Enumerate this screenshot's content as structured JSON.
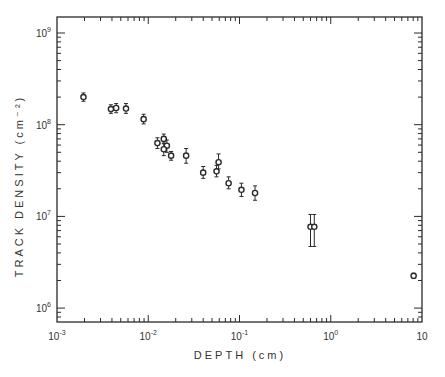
{
  "chart_data": {
    "type": "scatter",
    "title": "",
    "xlabel": "DEPTH (cm)",
    "ylabel": "TRACK DENSITY (cm⁻²)",
    "xscale": "log",
    "yscale": "log",
    "xlim": [
      0.001,
      10
    ],
    "ylim": [
      700000,
      1400000000
    ],
    "x_ticks": [
      {
        "value": 0.001,
        "base": "10",
        "exp": "-3"
      },
      {
        "value": 0.01,
        "base": "10",
        "exp": "-2"
      },
      {
        "value": 0.1,
        "base": "10",
        "exp": "-1"
      },
      {
        "value": 1,
        "base": "10",
        "exp": "0"
      },
      {
        "value": 10,
        "base": "10",
        "exp": ""
      }
    ],
    "y_ticks": [
      {
        "value": 1000000,
        "base": "10",
        "exp": "6"
      },
      {
        "value": 10000000,
        "base": "10",
        "exp": "7"
      },
      {
        "value": 100000000,
        "base": "10",
        "exp": "8"
      },
      {
        "value": 1000000000,
        "base": "10",
        "exp": "9"
      }
    ],
    "grid": false,
    "legend": null,
    "series": [
      {
        "name": "track density",
        "marker": "open-circle",
        "points": [
          {
            "x": 0.00195,
            "y": 200000000,
            "err_lo": 180000000,
            "err_hi": 222000000
          },
          {
            "x": 0.0039,
            "y": 148000000,
            "err_lo": 133000000,
            "err_hi": 165000000
          },
          {
            "x": 0.00445,
            "y": 152000000,
            "err_lo": 135000000,
            "err_hi": 170000000
          },
          {
            "x": 0.0057,
            "y": 150000000,
            "err_lo": 133000000,
            "err_hi": 170000000
          },
          {
            "x": 0.0089,
            "y": 115000000,
            "err_lo": 102000000,
            "err_hi": 130000000
          },
          {
            "x": 0.0126,
            "y": 63000000,
            "err_lo": 55000000,
            "err_hi": 72000000
          },
          {
            "x": 0.0148,
            "y": 70000000,
            "err_lo": 62000000,
            "err_hi": 79000000
          },
          {
            "x": 0.016,
            "y": 59000000,
            "err_lo": 50000000,
            "err_hi": 68000000
          },
          {
            "x": 0.0148,
            "y": 54000000,
            "err_lo": 46000000,
            "err_hi": 63000000
          },
          {
            "x": 0.0178,
            "y": 46000000,
            "err_lo": 41000000,
            "err_hi": 51000000
          },
          {
            "x": 0.026,
            "y": 46000000,
            "err_lo": 38000000,
            "err_hi": 55000000
          },
          {
            "x": 0.04,
            "y": 30000000,
            "err_lo": 26000000,
            "err_hi": 35000000
          },
          {
            "x": 0.056,
            "y": 31000000,
            "err_lo": 27000000,
            "err_hi": 36000000
          },
          {
            "x": 0.059,
            "y": 39000000,
            "err_lo": 33000000,
            "err_hi": 48000000
          },
          {
            "x": 0.076,
            "y": 23000000,
            "err_lo": 20000000,
            "err_hi": 27000000
          },
          {
            "x": 0.105,
            "y": 19500000,
            "err_lo": 16500000,
            "err_hi": 23000000
          },
          {
            "x": 0.148,
            "y": 18000000,
            "err_lo": 15000000,
            "err_hi": 21500000
          },
          {
            "x": 0.6,
            "y": 7700000,
            "err_lo": 4700000,
            "err_hi": 10500000
          },
          {
            "x": 0.66,
            "y": 7700000,
            "err_lo": 4700000,
            "err_hi": 10500000
          },
          {
            "x": 8.1,
            "y": 2250000,
            "err_lo": 2100000,
            "err_hi": 2400000
          }
        ]
      }
    ]
  },
  "colors": {
    "ink": "#2a2a2a",
    "background": "#ffffff"
  }
}
